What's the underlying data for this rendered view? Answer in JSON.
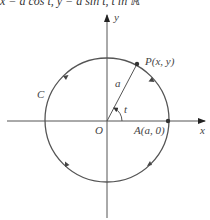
{
  "caption": "x = a cos t, y = a sin t, t in ℝ",
  "diagram": {
    "type": "parametric-circle",
    "axes": {
      "x_label": "x",
      "y_label": "y",
      "origin_label": "O"
    },
    "circle": {
      "label": "C",
      "radius_label": "a",
      "direction": "counterclockwise"
    },
    "points": {
      "P": "P(x, y)",
      "A": "A(a, 0)"
    },
    "angle_label": "t",
    "colors": {
      "curve": "#555555",
      "axes": "#444444",
      "text": "#444444"
    }
  }
}
